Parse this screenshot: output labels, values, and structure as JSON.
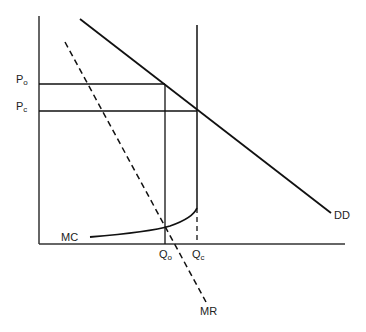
{
  "diagram": {
    "type": "monopoly-pricing",
    "labels": {
      "price_monopoly": {
        "main": "P",
        "sub": "o"
      },
      "price_competitive": {
        "main": "P",
        "sub": "c"
      },
      "quantity_monopoly": {
        "main": "Q",
        "sub": "o"
      },
      "quantity_competitive": {
        "main": "Q",
        "sub": "c"
      },
      "marginal_cost": "MC",
      "demand": "DD",
      "marginal_revenue": "MR"
    },
    "colors": {
      "line": "#111111",
      "axis": "#333333",
      "background": "#ffffff"
    }
  }
}
